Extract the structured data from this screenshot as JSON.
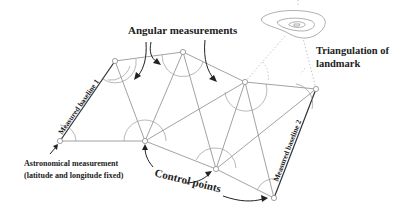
{
  "diagram": {
    "labels": {
      "angular": "Angular measurements",
      "triangulation_line1": "Triangulation of",
      "triangulation_line2": "landmark",
      "baseline1": "Measured baseline 1",
      "baseline2": "Measured baseline 2",
      "astro_line1": "Astronomical measurement",
      "astro_line2": "(latitude and longitude fixed)",
      "control": "Control points"
    },
    "colors": {
      "text": "#222222",
      "lines": "#8a8a8a",
      "baseline": "#333333",
      "background": "#ffffff"
    },
    "nodes": [
      {
        "id": "A",
        "x": 60,
        "y": 141,
        "role": "astronomical-point"
      },
      {
        "id": "B",
        "x": 115,
        "y": 61
      },
      {
        "id": "C",
        "x": 183,
        "y": 52
      },
      {
        "id": "D",
        "x": 245,
        "y": 82
      },
      {
        "id": "E",
        "x": 316,
        "y": 89
      },
      {
        "id": "F",
        "x": 145,
        "y": 141,
        "role": "control-point"
      },
      {
        "id": "G",
        "x": 216,
        "y": 169,
        "role": "control-point"
      },
      {
        "id": "H",
        "x": 274,
        "y": 198,
        "role": "control-point"
      }
    ],
    "landmark": {
      "x": 295,
      "y": 25
    }
  }
}
